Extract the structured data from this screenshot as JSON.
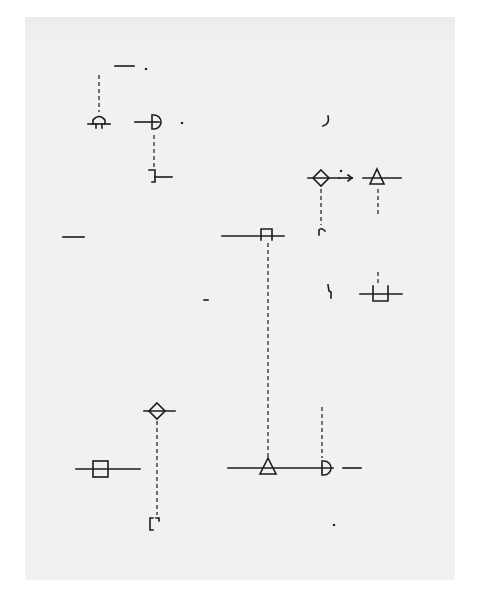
{
  "page": {
    "background": "#f1f1f0",
    "ink": "#1c1c1c",
    "bounds": [
      25,
      17,
      455,
      580
    ]
  },
  "elements": [
    {
      "id": "dash-top",
      "type": "line",
      "x1": 115,
      "y1": 66,
      "x2": 134,
      "y2": 66
    },
    {
      "id": "dot-top",
      "type": "dot",
      "x": 146,
      "y": 69
    },
    {
      "id": "vline-a",
      "type": "dashed",
      "x1": 99,
      "y1": 75,
      "x2": 99,
      "y2": 112
    },
    {
      "id": "fork-arch",
      "type": "arch-sym",
      "cx": 99,
      "cy": 122
    },
    {
      "id": "half-circle-a",
      "type": "halfcircle-sym",
      "cx": 153,
      "cy": 122
    },
    {
      "id": "dot-a",
      "type": "dot",
      "x": 182,
      "y": 123
    },
    {
      "id": "vline-b",
      "type": "dashed",
      "x1": 154,
      "y1": 135,
      "x2": 154,
      "y2": 168
    },
    {
      "id": "step-sym",
      "type": "step-sym",
      "cx": 160,
      "cy": 175
    },
    {
      "id": "curl-a",
      "type": "curl",
      "x": 326,
      "y": 122
    },
    {
      "id": "diamond-a",
      "type": "diamond-sym",
      "cx": 321,
      "cy": 178
    },
    {
      "id": "dot-b",
      "type": "dot",
      "x": 341,
      "y": 171
    },
    {
      "id": "triangle-a",
      "type": "triangle-sym",
      "cx": 377,
      "cy": 178
    },
    {
      "id": "vline-c",
      "type": "dashed",
      "x1": 321,
      "y1": 189,
      "x2": 321,
      "y2": 225
    },
    {
      "id": "vline-d",
      "type": "dashed",
      "x1": 378,
      "y1": 189,
      "x2": 378,
      "y2": 215
    },
    {
      "id": "arc-a",
      "type": "arc-hook",
      "x": 322,
      "y": 231
    },
    {
      "id": "dash-left",
      "type": "line",
      "x1": 63,
      "y1": 237,
      "x2": 84,
      "y2": 237
    },
    {
      "id": "gate-sym",
      "type": "gate-sym",
      "cx": 267,
      "cy": 236
    },
    {
      "id": "vline-e",
      "type": "dashed",
      "x1": 268,
      "y1": 243,
      "x2": 268,
      "y2": 458
    },
    {
      "id": "curl-b",
      "type": "curl2",
      "x": 330,
      "y": 292
    },
    {
      "id": "vline-f",
      "type": "dashed",
      "x1": 378,
      "y1": 272,
      "x2": 378,
      "y2": 284
    },
    {
      "id": "cup-sym",
      "type": "cup-sym",
      "cx": 380,
      "cy": 294
    },
    {
      "id": "dash-mid",
      "type": "line",
      "x1": 204,
      "y1": 300,
      "x2": 208,
      "y2": 300
    },
    {
      "id": "diamond-b",
      "type": "diamond-sym",
      "cx": 157,
      "cy": 411
    },
    {
      "id": "vline-g",
      "type": "dashed",
      "x1": 157,
      "y1": 421,
      "x2": 157,
      "y2": 515
    },
    {
      "id": "bracket-sym",
      "type": "bracket-sym",
      "x": 150,
      "y": 518
    },
    {
      "id": "square-sym",
      "type": "square-sym",
      "cx": 100,
      "cy": 469
    },
    {
      "id": "vline-h",
      "type": "dashed",
      "x1": 322,
      "y1": 407,
      "x2": 322,
      "y2": 458
    },
    {
      "id": "baseline",
      "type": "line",
      "x1": 228,
      "y1": 468,
      "x2": 333,
      "y2": 468
    },
    {
      "id": "triangle-b",
      "type": "triangle-sym-open",
      "cx": 268,
      "cy": 468
    },
    {
      "id": "half-circle-b",
      "type": "halfcircle-sym-open",
      "cx": 323,
      "cy": 468
    },
    {
      "id": "dash-right",
      "type": "line",
      "x1": 343,
      "y1": 468,
      "x2": 361,
      "y2": 468
    },
    {
      "id": "dot-bottom",
      "type": "dot",
      "x": 334,
      "y": 525
    }
  ]
}
